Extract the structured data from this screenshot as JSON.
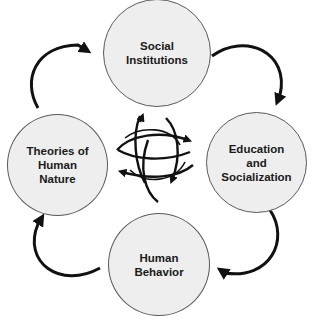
{
  "diagram": {
    "type": "cycle",
    "colors": {
      "node_fill": "#eeeeee",
      "node_border": "#5a5a5a",
      "arrow": "#111111",
      "background": "#ffffff"
    },
    "nodes": [
      {
        "id": "social-institutions",
        "label": "Social\nInstitutions",
        "position": "top"
      },
      {
        "id": "education-socialization",
        "label": "Education\nand\nSocialization",
        "position": "right"
      },
      {
        "id": "human-behavior",
        "label": "Human\nBehavior",
        "position": "bottom"
      },
      {
        "id": "theories-human-nature",
        "label": "Theories of\nHuman\nNature",
        "position": "left"
      }
    ],
    "edges": [
      {
        "from": "social-institutions",
        "to": "education-socialization",
        "direction": "clockwise"
      },
      {
        "from": "education-socialization",
        "to": "human-behavior",
        "direction": "clockwise"
      },
      {
        "from": "human-behavior",
        "to": "theories-human-nature",
        "direction": "clockwise"
      },
      {
        "from": "theories-human-nature",
        "to": "social-institutions",
        "direction": "clockwise"
      }
    ],
    "center_icon": "interlocking-cycle-arrows-icon"
  }
}
